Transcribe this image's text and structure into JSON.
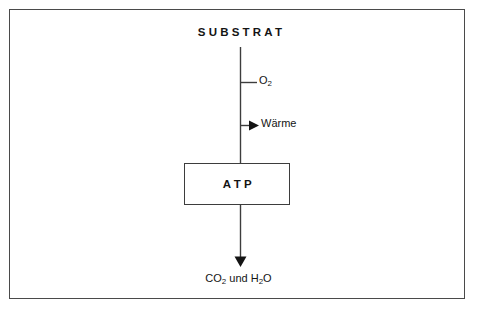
{
  "diagram": {
    "title": "SUBSTRAT",
    "frame": {
      "border_color": "#4a4a4a",
      "background_color": "#ffffff"
    },
    "line_color": "#3d3d3d",
    "text_color": "#141414",
    "nodes": {
      "substrate": {
        "label": "SUBSTRAT",
        "role": "input-substrate"
      },
      "oxygen": {
        "label_text": "O2",
        "label_main": "O",
        "label_sub": "2",
        "role": "branch-input"
      },
      "heat": {
        "label": "Wärme",
        "role": "branch-output"
      },
      "atp": {
        "label": "ATP",
        "role": "energy-product-box"
      },
      "products": {
        "label_text": "CO2 und H2O",
        "parts": {
          "first_main": "CO",
          "first_sub": "2",
          "conjunction": " und ",
          "second_main_a": "H",
          "second_sub": "2",
          "second_main_b": "O"
        },
        "role": "final-products"
      }
    }
  }
}
